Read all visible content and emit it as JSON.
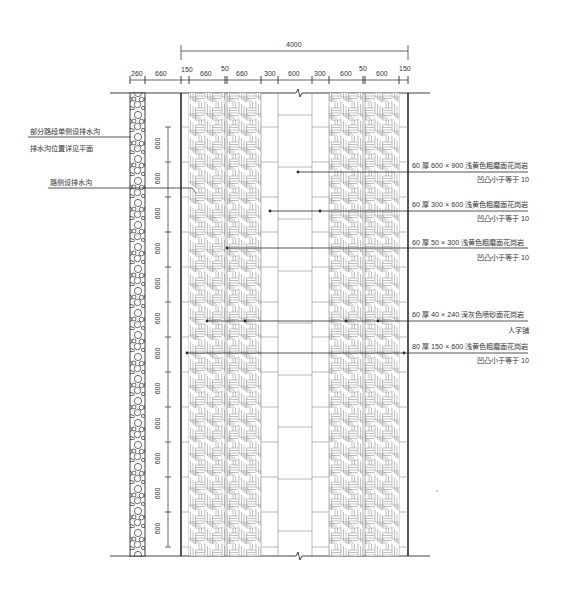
{
  "drawing": {
    "type": "paving-plan",
    "top_dimension_total": "4000",
    "top_dimensions": [
      "260",
      "660",
      "150",
      "660",
      "50",
      "660",
      "300",
      "600",
      "300",
      "600",
      "50",
      "600",
      "150"
    ],
    "vertical_module": "600",
    "vertical_dimensions": [
      "600",
      "600",
      "600",
      "600",
      "600",
      "600",
      "600",
      "600",
      "600",
      "600",
      "600",
      "600",
      "600"
    ]
  },
  "left_notes": [
    {
      "line1": "部分路段单侧设排水沟",
      "line2": "排水沟位置详见平面"
    },
    {
      "line1": "路侧设排水沟"
    }
  ],
  "right_notes": [
    {
      "line1": "60 厚 600 × 900 浅黄色粗磨面花岗岩",
      "line2": "凹凸小于等于 10"
    },
    {
      "line1": "60 厚 300 × 600 浅黄色粗磨面花岗岩",
      "line2": "凹凸小于等于 10"
    },
    {
      "line1": "60 厚 50 × 300 浅黄色粗磨面花岗岩",
      "line2": "凹凸小于等于 10"
    },
    {
      "line1": "60 厚 40 × 240 深灰色喷砂面花岗岩",
      "line2": "人字铺"
    },
    {
      "line1": "80 厚 150 × 600 浅黄色粗磨面花岗岩",
      "line2": "凹凸小于等于 10"
    }
  ],
  "colors": {
    "line": "#2a2a2a",
    "hatch": "#8a8a8a",
    "text": "#333333",
    "background": "#ffffff"
  }
}
